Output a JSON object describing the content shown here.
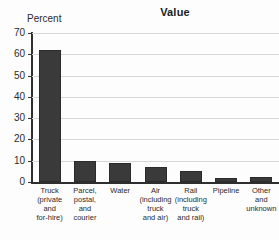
{
  "chart_data": {
    "type": "bar",
    "title": "Value",
    "xlabel": "",
    "ylabel": "Percent",
    "ylim": [
      0,
      70
    ],
    "ytick_step": 10,
    "yticks": [
      70,
      60,
      50,
      40,
      30,
      20,
      10,
      0
    ],
    "grid": true,
    "legend": false,
    "bar_color": "#3a3a3a",
    "background_color": "#fdfdfd",
    "gridline_color": "#d8d8d8",
    "axis_color": "#2f2f2f",
    "categories": [
      "Truck\n(private\nand\nfor-hire)",
      "Parcel,\npostal,\nand\ncourier",
      "Water",
      "Air\n(including\ntruck\nand air)",
      "Rail\n(including\ntruck\nand rail)",
      "Pipeline",
      "Other\nand\nunknown"
    ],
    "values": [
      62,
      10,
      9,
      7,
      5,
      2,
      2.5
    ]
  }
}
